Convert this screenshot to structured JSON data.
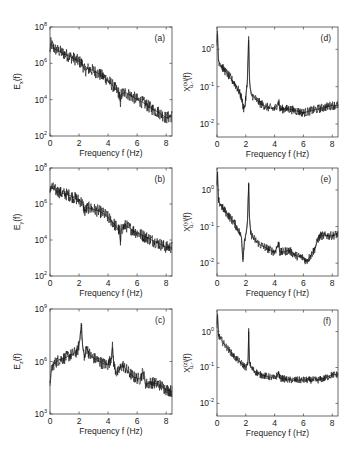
{
  "chart_data": [
    {
      "id": "a",
      "type": "line",
      "panel_label": "(a)",
      "xlabel": "Frequency f (Hz)",
      "ylabel": "E_x(f)",
      "ylabel_main": "E",
      "ylabel_sub": "x",
      "ylabel_tail": "(f)",
      "yscale": "log",
      "xlim": [
        0,
        8.4
      ],
      "ylim_exp": [
        2,
        8
      ],
      "xticks": [
        0,
        2,
        4,
        6,
        8
      ],
      "yticks_exp": [
        2,
        4,
        6,
        8
      ],
      "ytick_labels": [
        "10^2",
        "10^4",
        "10^6",
        "10^8"
      ],
      "series": [
        {
          "name": "E_x",
          "x": [
            0,
            0.05,
            0.3,
            0.8,
            1.3,
            1.8,
            2.2,
            2.4,
            2.6,
            3.0,
            3.4,
            3.8,
            4.2,
            4.6,
            4.8,
            4.85,
            4.9,
            5.2,
            5.6,
            6.0,
            6.5,
            7.0,
            7.5,
            8.0,
            8.4
          ],
          "y_exp": [
            6.6,
            7.1,
            6.8,
            6.6,
            6.4,
            6.2,
            6.0,
            5.6,
            5.7,
            5.6,
            5.4,
            5.2,
            4.9,
            4.5,
            4.3,
            3.6,
            4.3,
            4.4,
            4.2,
            4.0,
            3.8,
            3.5,
            3.3,
            3.0,
            3.1
          ],
          "noise_exp": 0.35
        }
      ]
    },
    {
      "id": "b",
      "type": "line",
      "panel_label": "(b)",
      "xlabel": "Frequency f (Hz)",
      "ylabel": "E_y(f)",
      "ylabel_main": "E",
      "ylabel_sub": "y",
      "ylabel_tail": "(f)",
      "yscale": "log",
      "xlim": [
        0,
        8.4
      ],
      "ylim_exp": [
        2,
        8
      ],
      "xticks": [
        0,
        2,
        4,
        6,
        8
      ],
      "yticks_exp": [
        2,
        4,
        6,
        8
      ],
      "ytick_labels": [
        "10^2",
        "10^4",
        "10^6",
        "10^8"
      ],
      "series": [
        {
          "name": "E_y",
          "x": [
            0,
            0.05,
            0.3,
            0.8,
            1.3,
            1.8,
            2.2,
            2.4,
            2.6,
            3.0,
            3.4,
            3.8,
            4.2,
            4.6,
            4.8,
            4.85,
            4.9,
            5.2,
            5.6,
            6.0,
            6.5,
            7.0,
            7.5,
            8.0,
            8.4
          ],
          "y_exp": [
            6.6,
            7.0,
            6.8,
            6.6,
            6.5,
            6.3,
            6.1,
            5.6,
            5.8,
            5.7,
            5.6,
            5.4,
            5.1,
            4.7,
            4.5,
            3.7,
            4.6,
            4.8,
            4.6,
            4.4,
            4.2,
            4.0,
            3.8,
            3.6,
            3.6
          ],
          "noise_exp": 0.35
        }
      ]
    },
    {
      "id": "c",
      "type": "line",
      "panel_label": "(c)",
      "xlabel": "Frequency f (Hz)",
      "ylabel": "E_z(f)",
      "ylabel_main": "E",
      "ylabel_sub": "z",
      "ylabel_tail": "(f)",
      "yscale": "log",
      "xlim": [
        0,
        8.4
      ],
      "ylim_exp": [
        3,
        9
      ],
      "xticks": [
        0,
        2,
        4,
        6,
        8
      ],
      "yticks_exp": [
        3,
        6,
        9
      ],
      "ytick_labels": [
        "10^3",
        "10^6",
        "10^9"
      ],
      "series": [
        {
          "name": "E_z",
          "x": [
            0,
            0.05,
            0.2,
            0.6,
            1.0,
            1.5,
            1.9,
            2.05,
            2.15,
            2.25,
            2.4,
            2.5,
            2.8,
            3.2,
            3.6,
            4.0,
            4.2,
            4.3,
            4.4,
            4.6,
            5.0,
            5.4,
            5.8,
            6.2,
            6.4,
            6.6,
            7.0,
            7.5,
            8.0,
            8.4
          ],
          "y_exp": [
            4.6,
            5.3,
            5.8,
            6.1,
            6.2,
            6.4,
            6.6,
            7.2,
            8.2,
            6.8,
            6.2,
            6.8,
            6.3,
            6.1,
            5.9,
            5.8,
            6.2,
            6.8,
            5.8,
            5.3,
            5.8,
            5.4,
            5.1,
            5.0,
            5.4,
            4.7,
            4.8,
            4.7,
            4.4,
            4.3
          ],
          "noise_exp": 0.35
        }
      ]
    },
    {
      "id": "d",
      "type": "line",
      "panel_label": "(d)",
      "xlabel": "Frequency f (Hz)",
      "ylabel": "X^(xi)_{u,-}(f)",
      "ylabel_main": "X",
      "ylabel_sup": "(x)",
      "ylabel_sub": "u,-",
      "ylabel_tail": "(f)",
      "yscale": "log",
      "xlim": [
        0,
        8.4
      ],
      "ylim_exp": [
        -2.35,
        0.6
      ],
      "xticks": [
        0,
        2,
        4,
        6,
        8
      ],
      "yticks_exp": [
        -2,
        -1,
        0
      ],
      "ytick_labels": [
        "10^-2",
        "10^-1",
        "10^0"
      ],
      "series": [
        {
          "name": "X_x",
          "x": [
            0,
            0.03,
            0.1,
            0.4,
            0.8,
            1.2,
            1.5,
            1.7,
            1.85,
            1.95,
            2.1,
            2.2,
            2.25,
            2.35,
            2.6,
            3.0,
            3.5,
            4.0,
            4.3,
            4.35,
            4.5,
            5.0,
            5.5,
            6.0,
            6.5,
            7.0,
            7.5,
            8.0,
            8.4
          ],
          "y_exp": [
            0.1,
            0.5,
            -0.3,
            -0.5,
            -0.7,
            -0.9,
            -1.1,
            -1.3,
            -1.6,
            -1.5,
            -0.9,
            0.35,
            -0.8,
            -1.2,
            -1.3,
            -1.45,
            -1.55,
            -1.6,
            -1.4,
            -1.6,
            -1.6,
            -1.6,
            -1.65,
            -1.7,
            -1.65,
            -1.6,
            -1.55,
            -1.5,
            -1.5
          ],
          "noise_exp": 0.12
        }
      ]
    },
    {
      "id": "e",
      "type": "line",
      "panel_label": "(e)",
      "xlabel": "Frequency f (Hz)",
      "ylabel": "X^(y)_{u,-}(f)",
      "ylabel_main": "X",
      "ylabel_sup": "(y)",
      "ylabel_sub": "u,-",
      "ylabel_tail": "(f)",
      "yscale": "log",
      "xlim": [
        0,
        8.4
      ],
      "ylim_exp": [
        -2.35,
        0.6
      ],
      "xticks": [
        0,
        2,
        4,
        6,
        8
      ],
      "yticks_exp": [
        -2,
        -1,
        0
      ],
      "ytick_labels": [
        "10^-2",
        "10^-1",
        "10^0"
      ],
      "series": [
        {
          "name": "X_y",
          "x": [
            0,
            0.03,
            0.1,
            0.4,
            0.8,
            1.2,
            1.5,
            1.7,
            1.8,
            1.9,
            2.1,
            2.2,
            2.25,
            2.35,
            2.6,
            3.0,
            3.5,
            4.0,
            4.3,
            4.35,
            4.5,
            5.0,
            5.5,
            6.0,
            6.2,
            6.5,
            6.8,
            7.0,
            7.2,
            7.5,
            8.0,
            8.4
          ],
          "y_exp": [
            0.1,
            0.5,
            -0.3,
            -0.5,
            -0.7,
            -0.9,
            -1.1,
            -1.3,
            -1.9,
            -1.4,
            -1.0,
            0.2,
            -0.8,
            -1.2,
            -1.35,
            -1.5,
            -1.6,
            -1.7,
            -1.45,
            -1.7,
            -1.7,
            -1.65,
            -1.8,
            -1.85,
            -1.95,
            -1.8,
            -1.6,
            -1.35,
            -1.25,
            -1.25,
            -1.25,
            -1.2
          ],
          "noise_exp": 0.12
        }
      ]
    },
    {
      "id": "f",
      "type": "line",
      "panel_label": "(f)",
      "xlabel": "Frequency f (Hz)",
      "ylabel": "X^(z)_{u,-}(f)",
      "ylabel_main": "X",
      "ylabel_sup": "(z)",
      "ylabel_sub": "u,-",
      "ylabel_tail": "(f)",
      "yscale": "log",
      "xlim": [
        0,
        8.4
      ],
      "ylim_exp": [
        -2.35,
        0.6
      ],
      "xticks": [
        0,
        2,
        4,
        6,
        8
      ],
      "yticks_exp": [
        -2,
        -1,
        0
      ],
      "ytick_labels": [
        "10^-2",
        "10^-1",
        "10^0"
      ],
      "series": [
        {
          "name": "X_z",
          "x": [
            0,
            0.03,
            0.1,
            0.4,
            0.8,
            1.2,
            1.6,
            2.0,
            2.15,
            2.2,
            2.25,
            2.35,
            2.6,
            3.0,
            3.5,
            4.0,
            4.3,
            4.35,
            4.5,
            5.0,
            5.5,
            6.0,
            6.5,
            7.0,
            7.5,
            8.0,
            8.4
          ],
          "y_exp": [
            0.1,
            0.5,
            -0.1,
            -0.3,
            -0.5,
            -0.7,
            -0.85,
            -1.0,
            -0.9,
            0.0,
            -0.8,
            -1.0,
            -1.1,
            -1.2,
            -1.25,
            -1.3,
            -1.15,
            -1.3,
            -1.3,
            -1.35,
            -1.35,
            -1.35,
            -1.35,
            -1.35,
            -1.3,
            -1.2,
            -1.2
          ],
          "noise_exp": 0.1
        }
      ]
    }
  ]
}
